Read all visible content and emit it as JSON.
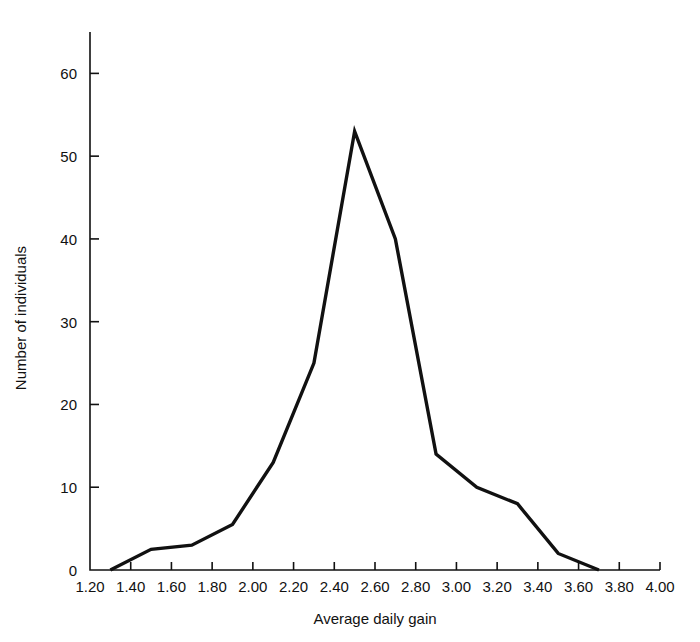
{
  "figure": {
    "background_color": "#ffffff",
    "line_color": "#111111",
    "axis_color": "#111111"
  },
  "chart_data": {
    "type": "line",
    "title": "",
    "subtitle": "",
    "xlabel": "Average daily gain",
    "ylabel": "Number of individuals",
    "xlim": [
      1.2,
      4.0
    ],
    "ylim": [
      0,
      65
    ],
    "grid": false,
    "legend": null,
    "legend_position": "none",
    "x_ticks": [
      1.2,
      1.4,
      1.6,
      1.8,
      2.0,
      2.2,
      2.4,
      2.6,
      2.8,
      3.0,
      3.2,
      3.4,
      3.6,
      3.8,
      4.0
    ],
    "x_tick_labels": [
      "1.20",
      "1.40",
      "1.60",
      "1.80",
      "2.00",
      "2.20",
      "2.40",
      "2.60",
      "2.80",
      "3.00",
      "3.20",
      "3.40",
      "3.60",
      "3.80",
      "4.00"
    ],
    "y_ticks": [
      0,
      10,
      20,
      30,
      40,
      50,
      60
    ],
    "y_tick_labels": [
      "0",
      "10",
      "20",
      "30",
      "40",
      "50",
      "60"
    ],
    "series": [
      {
        "name": "Frequency polygon",
        "x": [
          1.3,
          1.5,
          1.7,
          1.9,
          2.1,
          2.3,
          2.5,
          2.7,
          2.9,
          3.1,
          3.3,
          3.5,
          3.7
        ],
        "values": [
          0,
          2.5,
          3,
          5.5,
          13,
          25,
          53,
          40,
          14,
          10,
          8,
          2,
          0
        ]
      }
    ]
  }
}
